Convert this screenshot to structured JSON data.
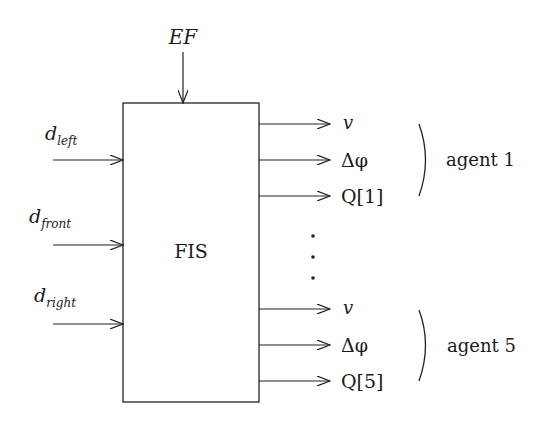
{
  "diagram": {
    "block_label": "FIS",
    "top_input": {
      "label": "EF"
    },
    "inputs": [
      {
        "base": "d",
        "sub": "left"
      },
      {
        "base": "d",
        "sub": "front"
      },
      {
        "base": "d",
        "sub": "right"
      }
    ],
    "output_groups": [
      {
        "agent_label": "agent 1",
        "outputs": [
          "v",
          "Δφ",
          "Q[1]"
        ]
      },
      {
        "agent_label": "agent 5",
        "outputs": [
          "v",
          "Δφ",
          "Q[5]"
        ]
      }
    ],
    "ellipsis": "⋮"
  }
}
